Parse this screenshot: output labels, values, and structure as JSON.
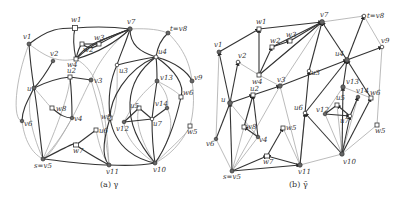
{
  "figure_a": {
    "caption": "(a) γ",
    "nodes": [
      {
        "id": "w1",
        "label": "w1",
        "x": 75,
        "y": 28,
        "shape": "square"
      },
      {
        "id": "v7",
        "label": "v7",
        "x": 130,
        "y": 29,
        "shape": "circle"
      },
      {
        "id": "v8",
        "label": "t=v8",
        "x": 168,
        "y": 33,
        "shape": "circle"
      },
      {
        "id": "v1",
        "label": "v1",
        "x": 29,
        "y": 44,
        "shape": "circle"
      },
      {
        "id": "w3",
        "label": "w3",
        "x": 99,
        "y": 44,
        "shape": "square"
      },
      {
        "id": "w2",
        "label": "w2",
        "x": 82,
        "y": 44,
        "shape": "square"
      },
      {
        "id": "v2",
        "label": "v2",
        "x": 53,
        "y": 61,
        "shape": "circle"
      },
      {
        "id": "w4",
        "label": "w4",
        "x": 76,
        "y": 59,
        "shape": "square"
      },
      {
        "id": "u4",
        "label": "u4",
        "x": 156,
        "y": 57,
        "shape": "circle"
      },
      {
        "id": "u3",
        "label": "u3",
        "x": 117,
        "y": 65,
        "shape": "circle"
      },
      {
        "id": "v9",
        "label": "v9",
        "x": 192,
        "y": 81,
        "shape": "circle"
      },
      {
        "id": "u2",
        "label": "u2",
        "x": 70,
        "y": 77,
        "shape": "square"
      },
      {
        "id": "v3",
        "label": "v3",
        "x": 91,
        "y": 80,
        "shape": "circle"
      },
      {
        "id": "v13",
        "label": "v13",
        "x": 157,
        "y": 81,
        "shape": "circle"
      },
      {
        "id": "u",
        "label": "u",
        "x": 34,
        "y": 88,
        "shape": "circle"
      },
      {
        "id": "w8",
        "label": "w8",
        "x": 52,
        "y": 108,
        "shape": "square"
      },
      {
        "id": "w6",
        "label": "w6",
        "x": 181,
        "y": 97,
        "shape": "square"
      },
      {
        "id": "v4",
        "label": "v4",
        "x": 72,
        "y": 118,
        "shape": "circle"
      },
      {
        "id": "u5",
        "label": "u5",
        "x": 139,
        "y": 108,
        "shape": "square"
      },
      {
        "id": "v14",
        "label": "v14",
        "x": 167,
        "y": 108,
        "shape": "circle"
      },
      {
        "id": "v6",
        "label": "v6",
        "x": 22,
        "y": 121,
        "shape": "circle"
      },
      {
        "id": "w5b",
        "label": "w5",
        "x": 110,
        "y": 118,
        "shape": "square"
      },
      {
        "id": "v12",
        "label": "v12",
        "x": 124,
        "y": 122,
        "shape": "circle"
      },
      {
        "id": "u7",
        "label": "u7",
        "x": 152,
        "y": 119,
        "shape": "circle"
      },
      {
        "id": "w5",
        "label": "w5",
        "x": 190,
        "y": 126,
        "shape": "square"
      },
      {
        "id": "u6",
        "label": "u6",
        "x": 96,
        "y": 130,
        "shape": "square"
      },
      {
        "id": "w7",
        "label": "w7",
        "x": 76,
        "y": 145,
        "shape": "square"
      },
      {
        "id": "v5",
        "label": "s=v5",
        "x": 43,
        "y": 159,
        "shape": "circle"
      },
      {
        "id": "v11",
        "label": "v11",
        "x": 109,
        "y": 165,
        "shape": "circle"
      },
      {
        "id": "v10",
        "label": "v10",
        "x": 155,
        "y": 163,
        "shape": "circle"
      }
    ]
  },
  "figure_b": {
    "caption": "(b) γ̄",
    "nodes": [
      {
        "id": "w1",
        "label": "w1",
        "x": 259,
        "y": 29,
        "shape": "square"
      },
      {
        "id": "v7",
        "label": "v7",
        "x": 322,
        "y": 22,
        "shape": "circle"
      },
      {
        "id": "v8",
        "label": "t=v8",
        "x": 364,
        "y": 16,
        "shape": "circle"
      },
      {
        "id": "v1",
        "label": "v1",
        "x": 219,
        "y": 52,
        "shape": "circle"
      },
      {
        "id": "w3",
        "label": "w3",
        "x": 290,
        "y": 41,
        "shape": "square"
      },
      {
        "id": "w2",
        "label": "w2",
        "x": 272,
        "y": 47,
        "shape": "square"
      },
      {
        "id": "v2",
        "label": "v2",
        "x": 238,
        "y": 62,
        "shape": "circle"
      },
      {
        "id": "w4",
        "label": "w4",
        "x": 259,
        "y": 75,
        "shape": "square"
      },
      {
        "id": "u4",
        "label": "u4",
        "x": 347,
        "y": 60,
        "shape": "circle"
      },
      {
        "id": "u3",
        "label": "u3",
        "x": 309,
        "y": 71,
        "shape": "circle"
      },
      {
        "id": "v9",
        "label": "v9",
        "x": 382,
        "y": 47,
        "shape": "circle"
      },
      {
        "id": "u2",
        "label": "u2",
        "x": 253,
        "y": 95,
        "shape": "square"
      },
      {
        "id": "v3",
        "label": "v3",
        "x": 280,
        "y": 86,
        "shape": "circle"
      },
      {
        "id": "v13",
        "label": "v13",
        "x": 343,
        "y": 87,
        "shape": "circle"
      },
      {
        "id": "u",
        "label": "u",
        "x": 230,
        "y": 103,
        "shape": "circle"
      },
      {
        "id": "w8",
        "label": "w8",
        "x": 244,
        "y": 127,
        "shape": "square"
      },
      {
        "id": "w6",
        "label": "w6",
        "x": 371,
        "y": 98,
        "shape": "square"
      },
      {
        "id": "v4",
        "label": "v4",
        "x": 258,
        "y": 137,
        "shape": "circle"
      },
      {
        "id": "u5",
        "label": "u5",
        "x": 337,
        "y": 105,
        "shape": "square"
      },
      {
        "id": "v14",
        "label": "v14",
        "x": 358,
        "y": 97,
        "shape": "circle"
      },
      {
        "id": "v6",
        "label": "v6",
        "x": 216,
        "y": 139,
        "shape": "circle"
      },
      {
        "id": "w5b",
        "label": "w5",
        "x": 283,
        "y": 128,
        "shape": "square"
      },
      {
        "id": "v12",
        "label": "v12",
        "x": 325,
        "y": 114,
        "shape": "circle"
      },
      {
        "id": "u7",
        "label": "u7",
        "x": 350,
        "y": 116,
        "shape": "circle"
      },
      {
        "id": "w5",
        "label": "w5",
        "x": 377,
        "y": 125,
        "shape": "square"
      },
      {
        "id": "u6",
        "label": "u6",
        "x": 305,
        "y": 113,
        "shape": "square"
      },
      {
        "id": "w7",
        "label": "w7",
        "x": 267,
        "y": 156,
        "shape": "square"
      },
      {
        "id": "v5",
        "label": "s=v5",
        "x": 232,
        "y": 171,
        "shape": "circle"
      },
      {
        "id": "v11",
        "label": "v11",
        "x": 300,
        "y": 165,
        "shape": "circle"
      },
      {
        "id": "v10",
        "label": "v10",
        "x": 342,
        "y": 154,
        "shape": "circle"
      }
    ]
  }
}
